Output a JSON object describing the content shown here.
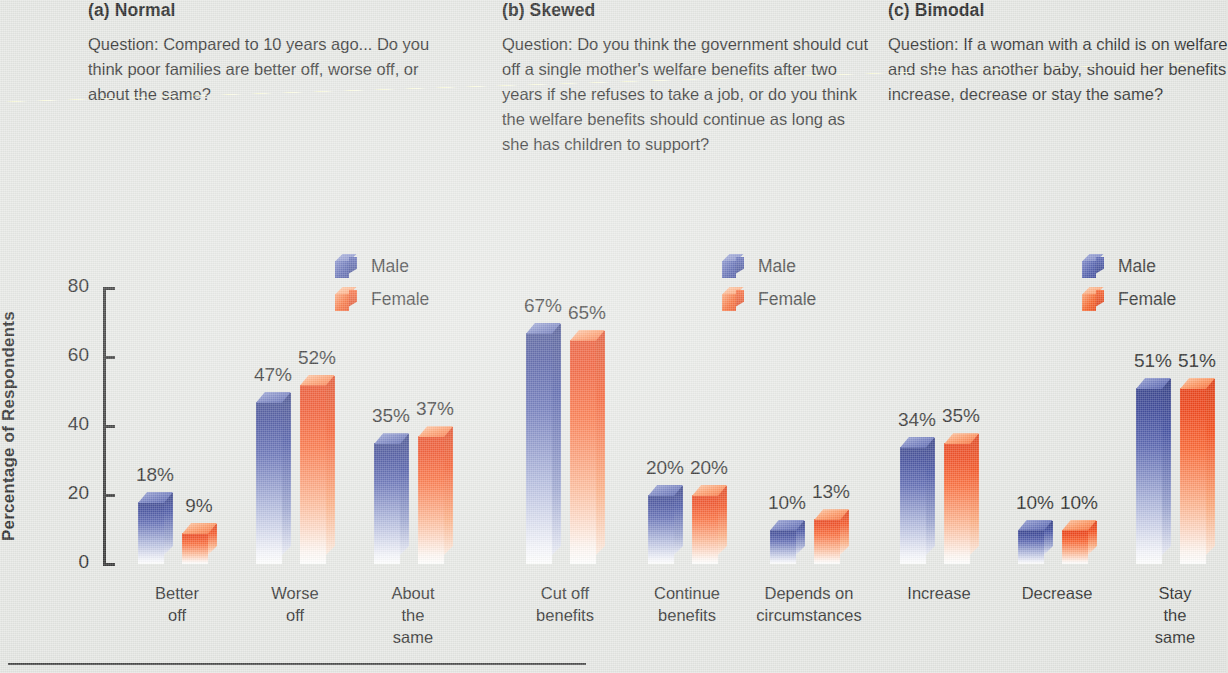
{
  "figure": {
    "ylabel": "Percentage of Respondents",
    "y_ticks": [
      "0",
      "20",
      "40",
      "60",
      "80"
    ],
    "legend": {
      "male": "Male",
      "female": "Female"
    },
    "colors": {
      "male": "#2a3790",
      "female": "#ef3505",
      "background": "#e4e6e2",
      "text": "#1b1b1b"
    }
  },
  "panels": [
    {
      "id": "a",
      "title": "(a) Normal",
      "question": "Question:  Compared to 10 years ago...  Do you think poor families are better off, worse off, or about the same?"
    },
    {
      "id": "b",
      "title": "(b) Skewed",
      "question": "Question:  Do you think the government should cut off a single mother's welfare benefits after two years if she refuses to take a job, or do you think the welfare benefits should continue as long as she has children to support?"
    },
    {
      "id": "c",
      "title": "(c) Bimodal",
      "question": "Question:  If a woman with a child is on welfare and she has another baby, should her benefits increase, decrease or stay the same?"
    }
  ],
  "chart_data": [
    {
      "type": "bar",
      "title": "(a) Normal",
      "categories": [
        "Better\noff",
        "Worse\noff",
        "About the\nsame"
      ],
      "series": [
        {
          "name": "Male",
          "values": [
            18,
            47,
            35
          ],
          "labels": [
            "18%",
            "47%",
            "35%"
          ]
        },
        {
          "name": "Female",
          "values": [
            9,
            52,
            37
          ],
          "labels": [
            "9%",
            "52%",
            "37%"
          ]
        }
      ],
      "xlabel": "",
      "ylabel": "Percentage of Respondents",
      "ylim": [
        0,
        80
      ],
      "yticks": [
        0,
        20,
        40,
        60,
        80
      ],
      "grid": false,
      "legend_position": "upper-right"
    },
    {
      "type": "bar",
      "title": "(b) Skewed",
      "categories": [
        "Cut off\nbenefits",
        "Continue\nbenefits",
        "Depends on\ncircumstances"
      ],
      "series": [
        {
          "name": "Male",
          "values": [
            67,
            20,
            10
          ],
          "labels": [
            "67%",
            "20%",
            "10%"
          ]
        },
        {
          "name": "Female",
          "values": [
            65,
            20,
            13
          ],
          "labels": [
            "65%",
            "20%",
            "13%"
          ]
        }
      ],
      "xlabel": "",
      "ylabel": "Percentage of Respondents",
      "ylim": [
        0,
        80
      ],
      "yticks": [
        0,
        20,
        40,
        60,
        80
      ],
      "grid": false,
      "legend_position": "upper-right"
    },
    {
      "type": "bar",
      "title": "(c) Bimodal",
      "categories": [
        "Increase",
        "Decrease",
        "Stay the\nsame"
      ],
      "series": [
        {
          "name": "Male",
          "values": [
            34,
            10,
            51
          ],
          "labels": [
            "34%",
            "10%",
            "51%"
          ]
        },
        {
          "name": "Female",
          "values": [
            35,
            10,
            51
          ],
          "labels": [
            "35%",
            "10%",
            "51%"
          ]
        }
      ],
      "xlabel": "",
      "ylabel": "Percentage of Respondents",
      "ylim": [
        0,
        80
      ],
      "yticks": [
        0,
        20,
        40,
        60,
        80
      ],
      "grid": false,
      "legend_position": "upper-right"
    }
  ]
}
